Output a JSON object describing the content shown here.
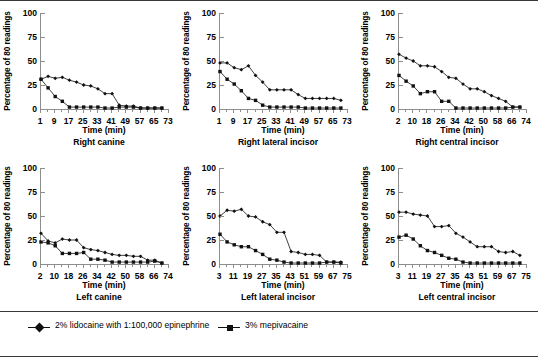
{
  "figure": {
    "ylabel": "Percentage of 80 readings",
    "xlabel": "Time (min)",
    "yticks": [
      0,
      25,
      50,
      75,
      100
    ],
    "ylim": [
      0,
      100
    ]
  },
  "legend": {
    "items": [
      {
        "label": "2% lidocaine with 1:100,000 epinephrine",
        "marker": "diamond-marker",
        "color": "#111111"
      },
      {
        "label": "3% mepivacaine",
        "marker": "square-marker",
        "color": "#111111"
      }
    ]
  },
  "chart_data": [
    {
      "type": "line",
      "title": "Right canine",
      "xlabel": "Time (min)",
      "ylabel": "Percentage of 80 readings",
      "xticks": [
        1,
        9,
        17,
        25,
        33,
        41,
        49,
        57,
        65,
        73
      ],
      "xlim": [
        1,
        73
      ],
      "ylim": [
        0,
        100
      ],
      "yticks": [
        0,
        25,
        50,
        75,
        100
      ],
      "grid": false,
      "legend_position": "below-figure",
      "x": [
        1,
        5,
        9,
        13,
        17,
        21,
        25,
        29,
        33,
        37,
        41,
        45,
        49,
        53,
        57,
        61,
        65,
        69
      ],
      "series": [
        {
          "name": "2% lidocaine with 1:100,000 epinephrine",
          "values": [
            31,
            34,
            32,
            33,
            30,
            28,
            25,
            24,
            21,
            16,
            16,
            4,
            3,
            3,
            1,
            1,
            1,
            1
          ]
        },
        {
          "name": "3% mepivacaine",
          "values": [
            31,
            22,
            13,
            8,
            2,
            2,
            2,
            2,
            2,
            1,
            1,
            2,
            2,
            2,
            1,
            1,
            1,
            1
          ]
        }
      ]
    },
    {
      "type": "line",
      "title": "Right lateral incisor",
      "xlabel": "Time (min)",
      "ylabel": "Percentage of 80 readings",
      "xticks": [
        1,
        9,
        17,
        25,
        33,
        41,
        49,
        57,
        65,
        73
      ],
      "xlim": [
        1,
        73
      ],
      "ylim": [
        0,
        100
      ],
      "yticks": [
        0,
        25,
        50,
        75,
        100
      ],
      "grid": false,
      "legend_position": "below-figure",
      "x": [
        1,
        5,
        9,
        13,
        17,
        21,
        25,
        29,
        33,
        37,
        41,
        45,
        49,
        53,
        57,
        61,
        65,
        69
      ],
      "series": [
        {
          "name": "2% lidocaine with 1:100,000 epinephrine",
          "values": [
            48,
            48,
            43,
            41,
            45,
            35,
            28,
            20,
            20,
            20,
            20,
            15,
            11,
            11,
            11,
            11,
            11,
            9
          ]
        },
        {
          "name": "3% mepivacaine",
          "values": [
            39,
            31,
            26,
            19,
            11,
            9,
            4,
            2,
            2,
            2,
            2,
            2,
            1,
            1,
            1,
            1,
            1,
            1
          ]
        }
      ]
    },
    {
      "type": "line",
      "title": "Right central incisor",
      "xlabel": "Time (min)",
      "ylabel": "Percentage of 80 readings",
      "xticks": [
        2,
        10,
        18,
        26,
        34,
        42,
        50,
        58,
        66,
        74
      ],
      "xlim": [
        2,
        74
      ],
      "ylim": [
        0,
        100
      ],
      "yticks": [
        0,
        25,
        50,
        75,
        100
      ],
      "grid": false,
      "legend_position": "below-figure",
      "x": [
        2,
        6,
        10,
        14,
        18,
        22,
        26,
        30,
        34,
        38,
        42,
        46,
        50,
        54,
        58,
        62,
        66,
        70
      ],
      "series": [
        {
          "name": "2% lidocaine with 1:100,000 epinephrine",
          "values": [
            57,
            53,
            50,
            45,
            45,
            44,
            39,
            33,
            32,
            26,
            21,
            21,
            18,
            14,
            11,
            8,
            2,
            2
          ]
        },
        {
          "name": "3% mepivacaine",
          "values": [
            35,
            29,
            24,
            16,
            18,
            18,
            8,
            8,
            1,
            1,
            1,
            1,
            1,
            1,
            1,
            1,
            2,
            2
          ]
        }
      ]
    },
    {
      "type": "line",
      "title": "Left canine",
      "xlabel": "Time (min)",
      "ylabel": "Percentage of 80 readings",
      "xticks": [
        2,
        10,
        18,
        26,
        34,
        42,
        50,
        58,
        66,
        74
      ],
      "xlim": [
        2,
        74
      ],
      "ylim": [
        0,
        100
      ],
      "yticks": [
        0,
        25,
        50,
        75,
        100
      ],
      "grid": false,
      "legend_position": "below-figure",
      "x": [
        2,
        6,
        10,
        14,
        18,
        22,
        26,
        30,
        34,
        38,
        42,
        46,
        50,
        54,
        58,
        62,
        66,
        70
      ],
      "series": [
        {
          "name": "2% lidocaine with 1:100,000 epinephrine",
          "values": [
            32,
            24,
            22,
            26,
            25,
            25,
            17,
            15,
            14,
            12,
            10,
            9,
            9,
            8,
            8,
            4,
            4,
            1
          ]
        },
        {
          "name": "3% mepivacaine",
          "values": [
            23,
            22,
            19,
            11,
            11,
            11,
            12,
            5,
            5,
            4,
            2,
            2,
            2,
            2,
            2,
            2,
            3,
            1
          ]
        }
      ]
    },
    {
      "type": "line",
      "title": "Left lateral incisor",
      "xlabel": "Time (min)",
      "ylabel": "Percentage of 80 readings",
      "xticks": [
        3,
        11,
        19,
        27,
        35,
        43,
        51,
        59,
        67,
        75
      ],
      "xlim": [
        3,
        75
      ],
      "ylim": [
        0,
        100
      ],
      "yticks": [
        0,
        25,
        50,
        75,
        100
      ],
      "grid": false,
      "legend_position": "below-figure",
      "x": [
        3,
        7,
        11,
        15,
        19,
        23,
        27,
        31,
        35,
        39,
        43,
        47,
        51,
        55,
        59,
        63,
        67,
        71
      ],
      "series": [
        {
          "name": "2% lidocaine with 1:100,000 epinephrine",
          "values": [
            50,
            56,
            55,
            57,
            50,
            49,
            44,
            41,
            33,
            33,
            13,
            12,
            10,
            10,
            9,
            2,
            2,
            2
          ]
        },
        {
          "name": "3% mepivacaine",
          "values": [
            31,
            23,
            20,
            18,
            18,
            14,
            10,
            5,
            4,
            2,
            1,
            1,
            1,
            1,
            1,
            2,
            2,
            1
          ]
        }
      ]
    },
    {
      "type": "line",
      "title": "Left central incisor",
      "xlabel": "Time (min)",
      "ylabel": "Percentage of 80 readings",
      "xticks": [
        3,
        11,
        19,
        27,
        35,
        43,
        51,
        59,
        67,
        75
      ],
      "xlim": [
        3,
        75
      ],
      "ylim": [
        0,
        100
      ],
      "yticks": [
        0,
        25,
        50,
        75,
        100
      ],
      "grid": false,
      "legend_position": "below-figure",
      "x": [
        3,
        7,
        11,
        15,
        19,
        23,
        27,
        31,
        35,
        39,
        43,
        47,
        51,
        55,
        59,
        63,
        67,
        71
      ],
      "series": [
        {
          "name": "2% lidocaine with 1:100,000 epinephrine",
          "values": [
            54,
            54,
            52,
            51,
            50,
            39,
            39,
            40,
            32,
            28,
            23,
            18,
            18,
            18,
            13,
            12,
            13,
            9
          ]
        },
        {
          "name": "3% mepivacaine",
          "values": [
            28,
            30,
            26,
            19,
            14,
            12,
            9,
            6,
            5,
            2,
            1,
            1,
            1,
            1,
            1,
            1,
            1,
            1
          ]
        }
      ]
    }
  ]
}
